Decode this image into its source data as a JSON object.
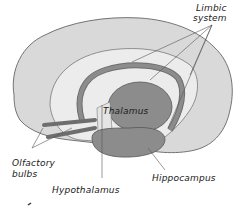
{
  "diagram": {
    "labels": {
      "limbic_line1": "Limbic",
      "limbic_line2": "system",
      "thalamus": "Thalamus",
      "olfactory_line1": "Olfactory",
      "olfactory_line2": "bulbs",
      "hippocampus": "Hippocampus",
      "hypothalamus": "Hypothalamus"
    },
    "colors": {
      "cortex": "#d9d9d9",
      "inner_region": "#ececec",
      "limbic_structures": "#8c8c8c",
      "outline": "#555555",
      "text": "#1a1a1a"
    }
  }
}
